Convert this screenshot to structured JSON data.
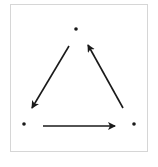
{
  "diagram": {
    "type": "directed-cycle",
    "colors": {
      "stroke": "#1a1a1a",
      "border": "#d6d6d6",
      "background": "#ffffff"
    },
    "nodes": [
      {
        "id": "top",
        "x": 76,
        "y": 29
      },
      {
        "id": "left",
        "x": 24,
        "y": 124
      },
      {
        "id": "right",
        "x": 134,
        "y": 124
      }
    ],
    "edges": [
      {
        "from": "top",
        "to": "left",
        "x1": 69,
        "y1": 46,
        "x2": 32,
        "y2": 108
      },
      {
        "from": "left",
        "to": "right",
        "x1": 43,
        "y1": 126,
        "x2": 115,
        "y2": 126
      },
      {
        "from": "right",
        "to": "top",
        "x1": 123,
        "y1": 108,
        "x2": 88,
        "y2": 45
      }
    ]
  }
}
